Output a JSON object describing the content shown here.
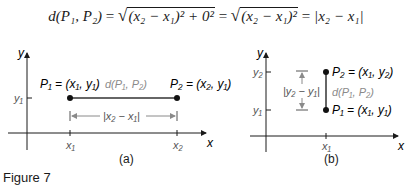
{
  "equation": {
    "lhs": "d(P₁, P₂)",
    "eq1": "=",
    "radicand1": "(x₂ − x₁)² + 0²",
    "eq2": "=",
    "radicand2": "(x₂ − x₁)²",
    "eq3": "=",
    "rhs": "|x₂ − x₁|"
  },
  "panel_a": {
    "y_axis_label": "y",
    "x_axis_label": "x",
    "y_tick": "y₁",
    "x_ticks": [
      "x₁",
      "x₂"
    ],
    "p1_label": "P₁ = (x₁, y₁)",
    "p2_label": "P₂ = (x₂, y₁)",
    "distance_label": "d(P₁, P₂)",
    "dimension_label": "|x₂ − x₁|",
    "caption": "(a)"
  },
  "panel_b": {
    "y_axis_label": "y",
    "x_axis_label": "x",
    "y_ticks": [
      "y₂",
      "y₁"
    ],
    "x_tick": "x₁",
    "p2_label": "P₂ = (x₁, y₂)",
    "p1_label": "P₁ = (x₁, y₁)",
    "distance_label": "d(P₁, P₂)",
    "dimension_label": "|y₂ − y₁|",
    "caption": "(b)"
  },
  "figure_label": "Figure 7",
  "colors": {
    "ink": "#1a1a1a",
    "gray_label": "#8a8a8a"
  }
}
